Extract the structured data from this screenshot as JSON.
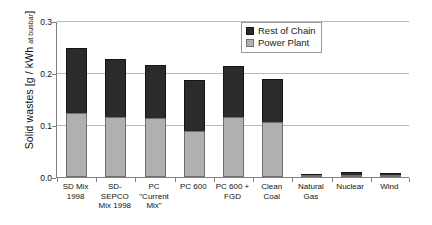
{
  "chart_data": {
    "type": "bar",
    "stacked": true,
    "title": "",
    "xlabel": "",
    "ylabel": "Solid wastes [g / kWh at busbar]",
    "ylabel_main": "Solid wastes [g / kWh ",
    "ylabel_sub": "at busbar",
    "ylabel_close": "]",
    "ylim": [
      0.0,
      0.3
    ],
    "yticks": [
      "0.0",
      "0.1",
      "0.2",
      "0.3"
    ],
    "ytick_values": [
      0.0,
      0.1,
      0.2,
      0.3
    ],
    "grid": true,
    "legend_position": "top-right",
    "categories": [
      "SD Mix 1998",
      "SD-SEPCO Mix 1998",
      "PC \"Current Mix\"",
      "PC 600",
      "PC 600 + FGD",
      "Clean Coal",
      "Natural Gas",
      "Nuclear",
      "Wind"
    ],
    "category_lines": [
      [
        "SD Mix",
        "1998"
      ],
      [
        "SD-",
        "SEPCO",
        "Mix 1998"
      ],
      [
        "PC",
        "\"Current",
        "Mix\""
      ],
      [
        "PC 600"
      ],
      [
        "PC 600 +",
        "FGD"
      ],
      [
        "Clean",
        "Coal"
      ],
      [
        "Natural",
        "Gas"
      ],
      [
        "Nuclear"
      ],
      [
        "Wind"
      ]
    ],
    "series": [
      {
        "name": "Power Plant",
        "color": "#b0b0b0",
        "values": [
          0.123,
          0.115,
          0.114,
          0.089,
          0.116,
          0.105,
          0.002,
          0.004,
          0.001
        ]
      },
      {
        "name": "Rest of Chain",
        "color": "#2b2b2b",
        "values": [
          0.125,
          0.111,
          0.102,
          0.097,
          0.097,
          0.083,
          0.002,
          0.005,
          0.003
        ]
      }
    ],
    "totals": [
      0.248,
      0.226,
      0.216,
      0.186,
      0.213,
      0.188,
      0.004,
      0.009,
      0.004
    ]
  },
  "legend": {
    "entries": [
      {
        "label": "Rest of Chain",
        "swatch": "dark-square-swatch"
      },
      {
        "label": "Power Plant",
        "swatch": "light-square-swatch"
      }
    ]
  }
}
